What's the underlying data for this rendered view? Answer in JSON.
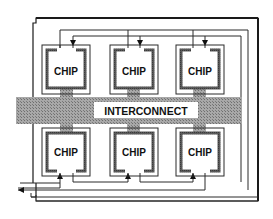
{
  "diagram": {
    "type": "multi-chip module with interconnect",
    "interconnect_label": "INTERCONNECT",
    "chips": [
      {
        "id": "chip-top-left",
        "label": "CHIP"
      },
      {
        "id": "chip-top-middle",
        "label": "CHIP"
      },
      {
        "id": "chip-top-right",
        "label": "CHIP"
      },
      {
        "id": "chip-bottom-left",
        "label": "CHIP"
      },
      {
        "id": "chip-bottom-middle",
        "label": "CHIP"
      },
      {
        "id": "chip-bottom-right",
        "label": "CHIP"
      }
    ],
    "colors": {
      "line": "#1a1a1a",
      "chip_border": "#555555",
      "interconnect_fill": "#9a9a9a",
      "background": "#ffffff",
      "label_bg": "#ffffff"
    }
  }
}
